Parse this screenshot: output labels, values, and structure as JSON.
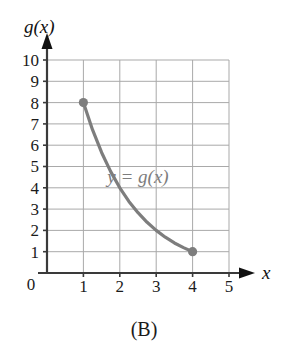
{
  "caption": "(B)",
  "axes": {
    "y_label": "g(x)",
    "x_label": "x",
    "origin_label": "0",
    "x_ticks": [
      "1",
      "2",
      "3",
      "4",
      "5"
    ],
    "y_ticks": [
      "1",
      "2",
      "3",
      "4",
      "5",
      "6",
      "7",
      "8",
      "9",
      "10"
    ]
  },
  "curve": {
    "label": "y = g(x)"
  },
  "colors": {
    "curve": "#7d7d7d",
    "point": "#7d7d7d",
    "grid": "#a9a9a9",
    "axis": "#3a3a3a",
    "text": "#1b1b1b"
  },
  "chart_data": {
    "type": "line",
    "title": "(B)",
    "xlabel": "x",
    "ylabel": "g(x)",
    "xlim": [
      0,
      5
    ],
    "ylim": [
      0,
      10
    ],
    "xticks": [
      0,
      1,
      2,
      3,
      4,
      5
    ],
    "yticks": [
      1,
      2,
      3,
      4,
      5,
      6,
      7,
      8,
      9,
      10
    ],
    "grid": true,
    "legend": "none",
    "annotations": [
      {
        "text": "y = g(x)",
        "x": 2.5,
        "y": 4.5
      }
    ],
    "series": [
      {
        "name": "y = g(x)",
        "domain": [
          1,
          4
        ],
        "endpoints_marked": [
          {
            "x": 1,
            "y": 8
          },
          {
            "x": 4,
            "y": 1
          }
        ],
        "x": [
          1,
          1.25,
          1.5,
          1.75,
          2,
          2.25,
          2.5,
          2.75,
          3,
          3.25,
          3.5,
          3.75,
          4
        ],
        "values": [
          8,
          6.73,
          5.66,
          4.76,
          4,
          3.36,
          2.83,
          2.38,
          2,
          1.68,
          1.41,
          1.19,
          1
        ]
      }
    ]
  }
}
